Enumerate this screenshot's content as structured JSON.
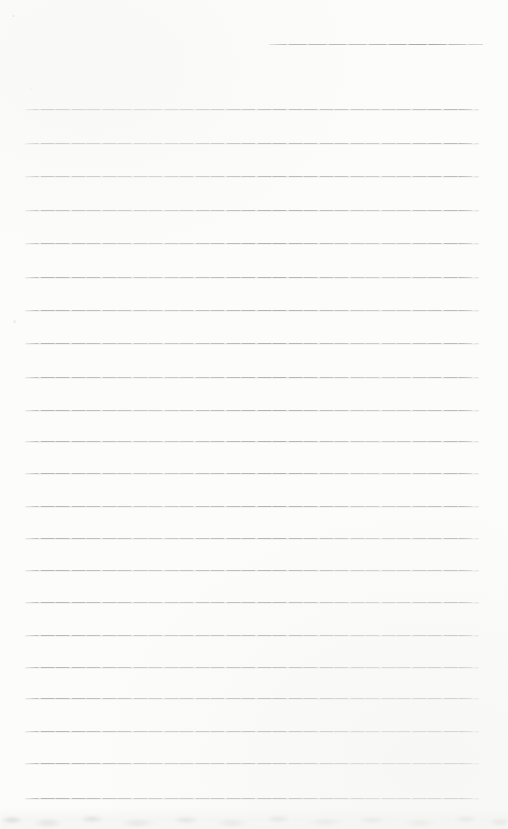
{
  "page": {
    "kind": "blank-ruled-notebook-page",
    "background_color": "#fcfcfb",
    "width_px": 508,
    "height_px": 829,
    "text_content": ""
  },
  "header_line": {
    "x": 269,
    "y": 44,
    "width": 214,
    "color": "#a6a6a4"
  },
  "ruled_lines": {
    "x": 25,
    "width": 454,
    "color": "#bcbcba",
    "count": 22,
    "y_positions": [
      109,
      143,
      176,
      210,
      243,
      277,
      310,
      343,
      377,
      410,
      441,
      473,
      506,
      538,
      570,
      602,
      635,
      667,
      698,
      731,
      763,
      798
    ]
  },
  "bottom_texture": {
    "y": 808,
    "height": 21,
    "tint": "#e9e9e6",
    "description": "illegible bleed-through mottling from page beneath"
  }
}
